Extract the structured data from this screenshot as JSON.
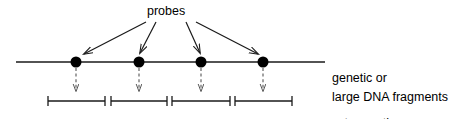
{
  "diagram": {
    "title_label": "probes",
    "map_label_line1": "genetic or",
    "map_label_line2": "cytogenetic",
    "fragments_label": "large DNA fragments",
    "colors": {
      "stroke": "#1a1a1a",
      "background": "#ffffff",
      "probe_dot": "#000000",
      "dashed": "#555555"
    },
    "map_line": {
      "x1": 16,
      "x2": 325,
      "y": 62
    },
    "probes": [
      {
        "id": "probe-1",
        "x": 76,
        "y": 62,
        "r": 5.5
      },
      {
        "id": "probe-2",
        "x": 139,
        "y": 62,
        "r": 5.5
      },
      {
        "id": "probe-3",
        "x": 201,
        "y": 62,
        "r": 5.5
      },
      {
        "id": "probe-4",
        "x": 263,
        "y": 62,
        "r": 5.5
      }
    ],
    "probe_arrows": [
      {
        "id": "probe-arrow-1",
        "x1": 146,
        "y1": 22,
        "x2": 84,
        "y2": 54
      },
      {
        "id": "probe-arrow-2",
        "x1": 156,
        "y1": 22,
        "x2": 140,
        "y2": 53
      },
      {
        "id": "probe-arrow-3",
        "x1": 186,
        "y1": 22,
        "x2": 200,
        "y2": 53
      },
      {
        "id": "probe-arrow-4",
        "x1": 196,
        "y1": 22,
        "x2": 258,
        "y2": 54
      }
    ],
    "dashed_arrows": [
      {
        "id": "dashed-arrow-1",
        "x": 76,
        "y1": 70,
        "y2": 90
      },
      {
        "id": "dashed-arrow-2",
        "x": 139,
        "y1": 70,
        "y2": 90
      },
      {
        "id": "dashed-arrow-3",
        "x": 201,
        "y1": 70,
        "y2": 90
      },
      {
        "id": "dashed-arrow-4",
        "x": 263,
        "y1": 70,
        "y2": 90
      }
    ],
    "fragments": [
      {
        "id": "fragment-1",
        "x1": 48,
        "x2": 105,
        "y": 101,
        "cap": 10
      },
      {
        "id": "fragment-2",
        "x1": 111,
        "x2": 167,
        "y": 101,
        "cap": 10
      },
      {
        "id": "fragment-3",
        "x1": 172,
        "x2": 230,
        "y": 101,
        "cap": 10
      },
      {
        "id": "fragment-4",
        "x1": 235,
        "x2": 292,
        "y": 101,
        "cap": 10
      }
    ]
  }
}
